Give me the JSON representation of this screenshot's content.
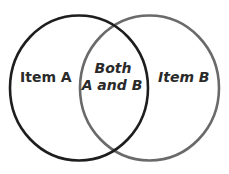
{
  "diagram": {
    "type": "venn",
    "sets": [
      {
        "id": "A",
        "label": "Item A",
        "stroke": "#1e1e1e"
      },
      {
        "id": "B",
        "label": "Item B",
        "stroke": "#6a6a6a"
      }
    ],
    "intersection": {
      "line1": "Both",
      "line2": "A and B"
    }
  }
}
